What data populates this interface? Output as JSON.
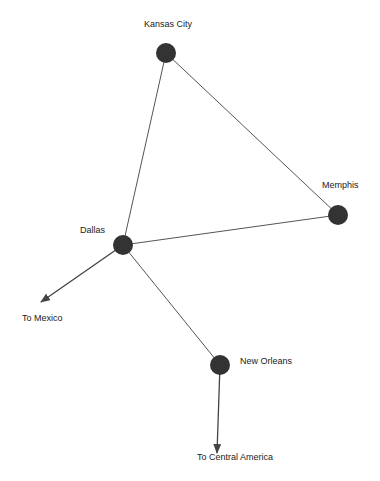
{
  "diagram": {
    "type": "network-graph",
    "node_color": "#333333",
    "edge_color": "#555555",
    "nodes": [
      {
        "id": "kansas_city",
        "label": "Kansas City",
        "x": 166,
        "y": 53
      },
      {
        "id": "memphis",
        "label": "Memphis",
        "x": 338,
        "y": 215
      },
      {
        "id": "dallas",
        "label": "Dallas",
        "x": 123,
        "y": 245
      },
      {
        "id": "new_orleans",
        "label": "New Orleans",
        "x": 220,
        "y": 365
      }
    ],
    "edges": [
      {
        "from": "kansas_city",
        "to": "memphis"
      },
      {
        "from": "kansas_city",
        "to": "dallas"
      },
      {
        "from": "dallas",
        "to": "memphis"
      },
      {
        "from": "dallas",
        "to": "new_orleans"
      }
    ],
    "arrows": [
      {
        "from": "dallas",
        "label": "To Mexico",
        "x2": 41,
        "y2": 302
      },
      {
        "from": "new_orleans",
        "label": "To Central America",
        "x2": 217,
        "y2": 453
      }
    ]
  }
}
